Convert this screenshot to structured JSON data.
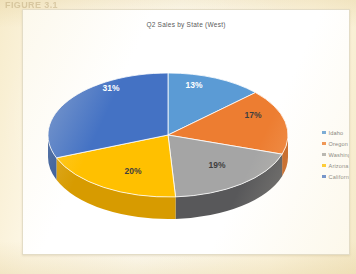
{
  "page": {
    "ghost_heading": "FIGURE 3.1",
    "background_color": "#fdf6e0",
    "card_color": "#ffffff"
  },
  "chart_card": {
    "title": "Q2 Sales by State (West)"
  },
  "chart_data": {
    "type": "pie",
    "title": "Q2 Sales by State (West)",
    "xlabel": "",
    "ylabel": "",
    "three_d": true,
    "legend_position": "right",
    "grid": false,
    "categories": [
      "Idaho",
      "Oregon",
      "Washington",
      "Arizona",
      "California"
    ],
    "values": [
      13,
      17,
      19,
      20,
      31
    ],
    "value_unit": "%",
    "data_labels": [
      "13%",
      "17%",
      "19%",
      "20%",
      "31%"
    ],
    "colors": [
      "#5B9BD5",
      "#ED7D31",
      "#A5A5A5",
      "#FFC000",
      "#4472C4"
    ],
    "side_colors": [
      "#3f7cb4",
      "#c4601c",
      "#58585a",
      "#d79b00",
      "#2f5597"
    ],
    "slices": [
      {
        "label": "Idaho",
        "value": 13,
        "data_label": "13%",
        "color": "#5B9BD5",
        "side_color": "#3f7cb4"
      },
      {
        "label": "Oregon",
        "value": 17,
        "data_label": "17%",
        "color": "#ED7D31",
        "side_color": "#c4601c"
      },
      {
        "label": "Washington",
        "value": 19,
        "data_label": "19%",
        "color": "#A5A5A5",
        "side_color": "#58585a"
      },
      {
        "label": "Arizona",
        "value": 20,
        "data_label": "20%",
        "color": "#FFC000",
        "side_color": "#d79b00"
      },
      {
        "label": "California",
        "value": 31,
        "data_label": "31%",
        "color": "#4472C4",
        "side_color": "#2f5597"
      }
    ]
  },
  "legend": {
    "items": [
      {
        "label": "Idaho",
        "color": "#5B9BD5"
      },
      {
        "label": "Oregon",
        "color": "#ED7D31"
      },
      {
        "label": "Washington",
        "color": "#A5A5A5"
      },
      {
        "label": "Arizona",
        "color": "#FFC000"
      },
      {
        "label": "California",
        "color": "#4472C4"
      }
    ]
  },
  "slice_label_positions": [
    {
      "x": 163,
      "y": 48,
      "light": true
    },
    {
      "x": 222,
      "y": 78,
      "light": false
    },
    {
      "x": 186,
      "y": 128,
      "light": false
    },
    {
      "x": 102,
      "y": 134,
      "light": false
    },
    {
      "x": 80,
      "y": 51,
      "light": true
    }
  ]
}
